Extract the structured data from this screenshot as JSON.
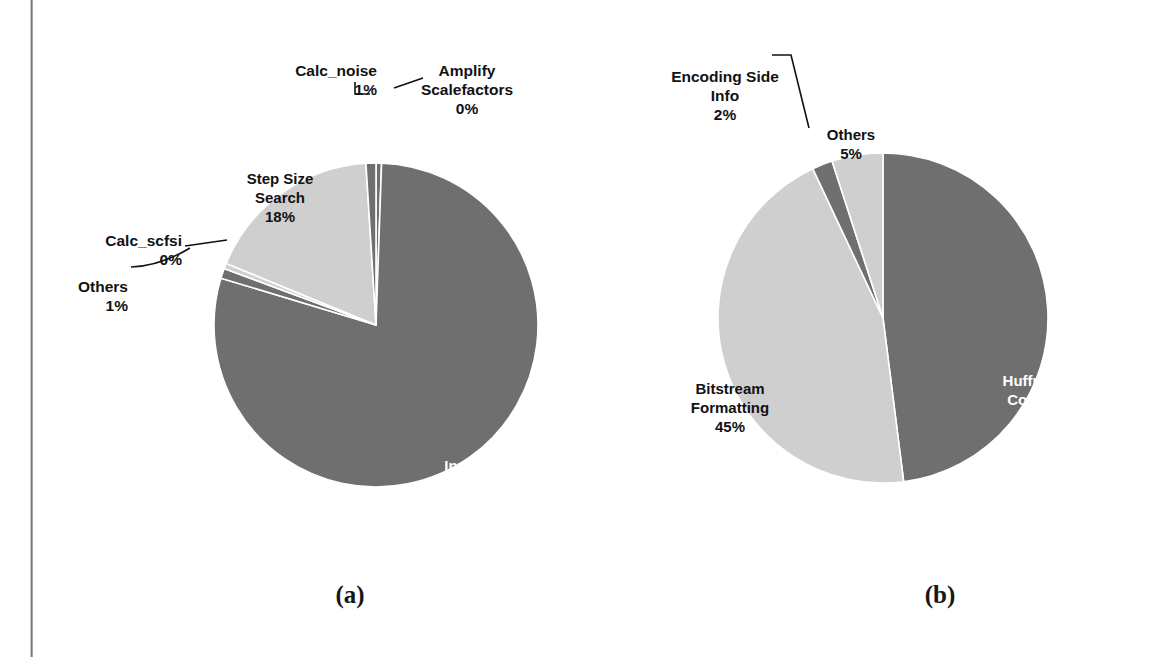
{
  "figure": {
    "caption_a": "(a)",
    "caption_b": "(b)"
  },
  "colors": {
    "dark_slice": "#6f6f6f",
    "light_slice": "#cfcfcf",
    "slice_border": "#ffffff",
    "label_dark_text": "#111111",
    "label_light_text": "#ffffff",
    "background": "#ffffff",
    "gutter_line": "#6e6e6e"
  },
  "chart_data": [
    {
      "type": "pie",
      "id": "chart-a",
      "title": "(a)",
      "categories": [
        "Amplify Scalefactors",
        "Inner Loop",
        "Others",
        "Calc_scfsi",
        "Step Size Search",
        "Calc_noise"
      ],
      "values": [
        0,
        80,
        1,
        0,
        18,
        1
      ],
      "labels": [
        {
          "name": "Amplify Scalefactors",
          "text": "Amplify\nScalefactors",
          "percent": "0%",
          "value": 0,
          "color": "#6f6f6f",
          "placement": "outside"
        },
        {
          "name": "Inner Loop",
          "text": "Inner Loop",
          "percent": "80%",
          "value": 80,
          "color": "#6f6f6f",
          "placement": "inside"
        },
        {
          "name": "Others",
          "text": "Others",
          "percent": "1%",
          "value": 1,
          "color": "#6f6f6f",
          "placement": "outside"
        },
        {
          "name": "Calc_scfsi",
          "text": "Calc_scfsi",
          "percent": "0%",
          "value": 0,
          "color": "#cfcfcf",
          "placement": "outside"
        },
        {
          "name": "Step Size Search",
          "text": "Step Size\nSearch",
          "percent": "18%",
          "value": 18,
          "color": "#cfcfcf",
          "placement": "inside"
        },
        {
          "name": "Calc_noise",
          "text": "Calc_noise",
          "percent": "1%",
          "value": 1,
          "color": "#6f6f6f",
          "placement": "outside"
        }
      ]
    },
    {
      "type": "pie",
      "id": "chart-b",
      "title": "(b)",
      "categories": [
        "Huffman Coding",
        "Bitstream Formatting",
        "Encoding Side Info",
        "Others"
      ],
      "values": [
        48,
        45,
        2,
        5
      ],
      "labels": [
        {
          "name": "Huffman Coding",
          "text": "Huffman\nCoding",
          "percent": "48%",
          "value": 48,
          "color": "#6f6f6f",
          "placement": "inside"
        },
        {
          "name": "Bitstream Formatting",
          "text": "Bitstream\nFormatting",
          "percent": "45%",
          "value": 45,
          "color": "#cfcfcf",
          "placement": "inside"
        },
        {
          "name": "Encoding Side Info",
          "text": "Encoding Side\nInfo",
          "percent": "2%",
          "value": 2,
          "color": "#6f6f6f",
          "placement": "outside"
        },
        {
          "name": "Others",
          "text": "Others",
          "percent": "5%",
          "value": 5,
          "color": "#cfcfcf",
          "placement": "inside"
        }
      ]
    }
  ]
}
